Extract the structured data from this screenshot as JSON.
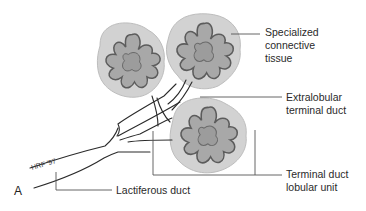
{
  "figure": {
    "panel_letter": "A",
    "signature": "HRF '97",
    "colors": {
      "connective_tissue": "#d2d2d2",
      "connective_outline": "#bdbdbd",
      "lobule_fill": "#a8a8a8",
      "lobule_outline": "#5c5c5c",
      "duct_line": "#2a2a2a",
      "leader_line": "#555555"
    },
    "labels": {
      "specialized_connective_tissue": [
        "Specialized",
        "connective",
        "tissue"
      ],
      "extralobular_terminal_duct": [
        "Extralobular",
        "terminal duct"
      ],
      "terminal_duct_lobular_unit": [
        "Terminal duct",
        "lobular unit"
      ],
      "lactiferous_duct": "Lactiferous duct"
    }
  }
}
